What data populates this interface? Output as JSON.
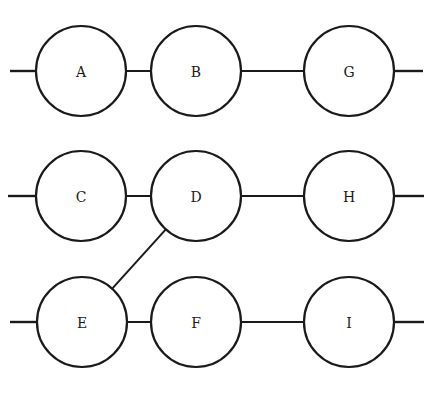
{
  "diagram": {
    "type": "network",
    "colors": {
      "stroke": "#1a1a1a",
      "background": "#ffffff",
      "node_fill": "#ffffff"
    },
    "node_radius": 45,
    "nodes": [
      {
        "id": "A",
        "label": "A",
        "x": 81,
        "y": 71
      },
      {
        "id": "B",
        "label": "B",
        "x": 196,
        "y": 71
      },
      {
        "id": "G",
        "label": "G",
        "x": 349,
        "y": 71
      },
      {
        "id": "C",
        "label": "C",
        "x": 81,
        "y": 196
      },
      {
        "id": "D",
        "label": "D",
        "x": 196,
        "y": 196
      },
      {
        "id": "H",
        "label": "H",
        "x": 349,
        "y": 196
      },
      {
        "id": "E",
        "label": "E",
        "x": 82,
        "y": 322
      },
      {
        "id": "F",
        "label": "F",
        "x": 196,
        "y": 322
      },
      {
        "id": "I",
        "label": "I",
        "x": 349,
        "y": 322
      }
    ],
    "edges": [
      {
        "from": "A",
        "to": "B"
      },
      {
        "from": "B",
        "to": "G"
      },
      {
        "from": "C",
        "to": "D"
      },
      {
        "from": "D",
        "to": "H"
      },
      {
        "from": "E",
        "to": "F"
      },
      {
        "from": "F",
        "to": "I"
      },
      {
        "from": "D",
        "to": "E"
      }
    ],
    "stubs": [
      {
        "node": "A",
        "side": "left",
        "x1": 10,
        "x2": 36
      },
      {
        "node": "G",
        "side": "right",
        "x1": 394,
        "x2": 423
      },
      {
        "node": "C",
        "side": "left",
        "x1": 8,
        "x2": 36
      },
      {
        "node": "H",
        "side": "right",
        "x1": 394,
        "x2": 424
      },
      {
        "node": "E",
        "side": "left",
        "x1": 10,
        "x2": 37
      },
      {
        "node": "I",
        "side": "right",
        "x1": 394,
        "x2": 424
      }
    ]
  }
}
